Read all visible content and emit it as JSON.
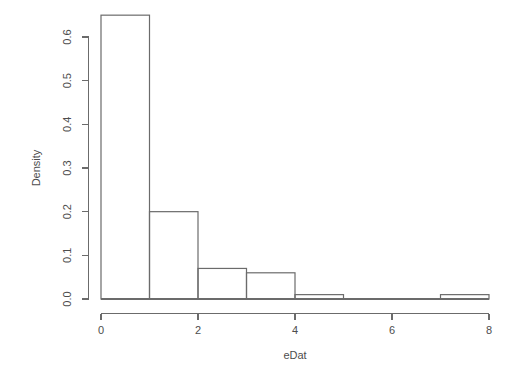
{
  "chart_data": {
    "type": "bar",
    "subtype": "histogram",
    "title": "",
    "xlabel": "eDat",
    "ylabel": "Density",
    "xlim": [
      0,
      8
    ],
    "ylim": [
      0.0,
      0.65
    ],
    "grid": false,
    "legend": null,
    "bin_width": 1,
    "bin_edges": [
      0,
      1,
      2,
      3,
      4,
      5,
      6,
      7,
      8
    ],
    "categories": [
      "0-1",
      "1-2",
      "2-3",
      "3-4",
      "4-5",
      "5-6",
      "6-7",
      "7-8"
    ],
    "values": [
      0.65,
      0.2,
      0.07,
      0.06,
      0.01,
      0.0,
      0.0,
      0.01
    ],
    "bars": [
      {
        "x0": 0,
        "x1": 1,
        "density": 0.65
      },
      {
        "x0": 1,
        "x1": 2,
        "density": 0.2
      },
      {
        "x0": 2,
        "x1": 3,
        "density": 0.07
      },
      {
        "x0": 3,
        "x1": 4,
        "density": 0.06
      },
      {
        "x0": 4,
        "x1": 5,
        "density": 0.01
      },
      {
        "x0": 5,
        "x1": 6,
        "density": 0.0
      },
      {
        "x0": 6,
        "x1": 7,
        "density": 0.0
      },
      {
        "x0": 7,
        "x1": 8,
        "density": 0.01
      }
    ],
    "x_ticks": [
      {
        "value": 0,
        "label": "0"
      },
      {
        "value": 2,
        "label": "2"
      },
      {
        "value": 4,
        "label": "4"
      },
      {
        "value": 6,
        "label": "6"
      },
      {
        "value": 8,
        "label": "8"
      }
    ],
    "y_ticks": [
      {
        "value": 0.0,
        "label": "0.0"
      },
      {
        "value": 0.1,
        "label": "0.1"
      },
      {
        "value": 0.2,
        "label": "0.2"
      },
      {
        "value": 0.3,
        "label": "0.3"
      },
      {
        "value": 0.4,
        "label": "0.4"
      },
      {
        "value": 0.5,
        "label": "0.5"
      },
      {
        "value": 0.6,
        "label": "0.6"
      }
    ],
    "colors": {
      "background": "#ffffff",
      "bar_stroke": "#6b6b6b",
      "bar_fill": "none",
      "axis": "#6b6b6b",
      "text": "#4d4d4d"
    }
  },
  "axis": {
    "x_title": "eDat",
    "y_title": "Density"
  }
}
